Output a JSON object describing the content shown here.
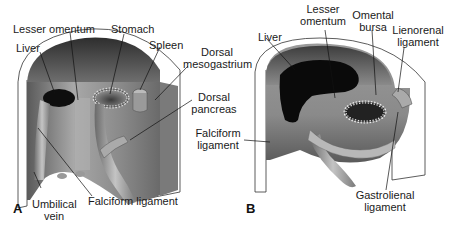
{
  "figure": {
    "panels": [
      {
        "letter": "A",
        "labels": {
          "lesser_omentum": "Lesser omentum",
          "stomach": "Stomach",
          "liver": "Liver",
          "spleen": "Spleen",
          "dorsal_mesogastrium_1": "Dorsal",
          "dorsal_mesogastrium_2": "mesogastrium",
          "dorsal_pancreas_1": "Dorsal",
          "dorsal_pancreas_2": "pancreas",
          "umbilical_vein_1": "Umbilical",
          "umbilical_vein_2": "vein",
          "falciform_ligament": "Falciform ligament"
        }
      },
      {
        "letter": "B",
        "labels": {
          "liver": "Liver",
          "lesser_omentum_1": "Lesser",
          "lesser_omentum_2": "omentum",
          "omental_bursa_1": "Omental",
          "omental_bursa_2": "bursa",
          "lienorenal_ligament_1": "Lienorenal",
          "lienorenal_ligament_2": "ligament",
          "falciform_ligament_1": "Falciform",
          "falciform_ligament_2": "ligament",
          "gastrolienal_ligament_1": "Gastrolienal",
          "gastrolienal_ligament_2": "ligament"
        }
      }
    ],
    "colors": {
      "wall_dark": "#3a3a3a",
      "wall_mid": "#8a8a8a",
      "wall_light": "#c8c8c8",
      "liver": "#111111",
      "outline": "#222222",
      "background": "#ffffff"
    }
  }
}
